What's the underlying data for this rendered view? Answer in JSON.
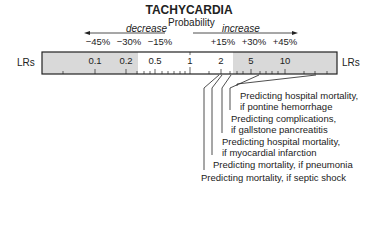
{
  "title": "TACHYCARDIA",
  "probability_label": "Probability",
  "decrease_label": "decrease",
  "increase_label": "increase",
  "axis_label_left": "LRs",
  "axis_label_right": "LRs",
  "percent_labels": [
    "−45%",
    "−30%",
    "−15%",
    "+15%",
    "+30%",
    "+45%"
  ],
  "lr_tick_labels": [
    "0.1",
    "0.2",
    "0.5",
    "1",
    "2",
    "5",
    "10"
  ],
  "annotations": [
    {
      "line1": "Predicting hospital mortality,",
      "line2": "if pontine hemorrhage"
    },
    {
      "line1": "Predicting complications,",
      "line2": "if gallstone pancreatitis"
    },
    {
      "line1": "Predicting hospital mortality,",
      "line2": "if myocardial infarction"
    },
    {
      "line1": "Predicting mortality, if pneumonia"
    },
    {
      "line1": "Predicting mortality, if septic shock"
    }
  ],
  "colors": {
    "shaded": "#d9d9d9",
    "line": "#222222"
  }
}
